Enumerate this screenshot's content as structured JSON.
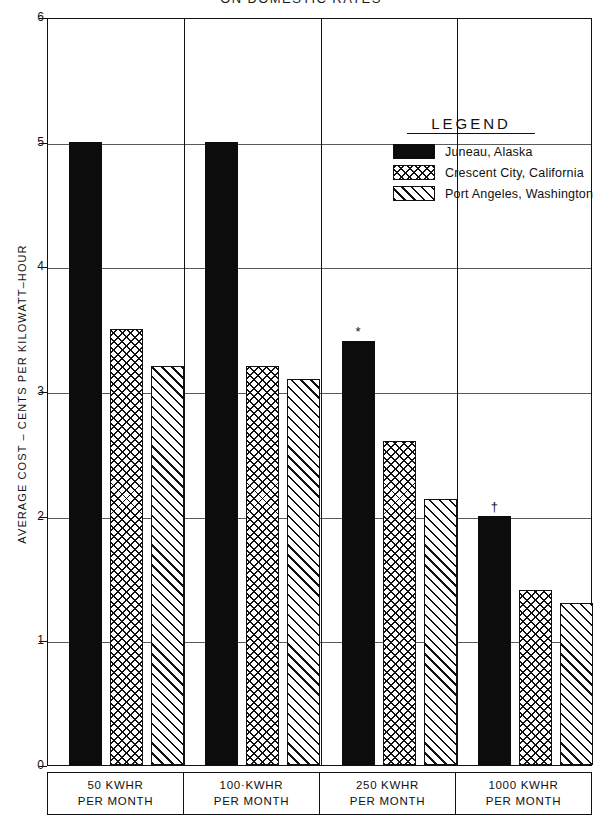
{
  "title": "ON  DOMESTIC  RATES",
  "legend": {
    "heading": "LEGEND",
    "entries": [
      {
        "label": "Juneau, Alaska",
        "pattern": "solid",
        "color": "#0c0c0c"
      },
      {
        "label": "Crescent City, California",
        "pattern": "cross",
        "color": "#111111"
      },
      {
        "label": "Port Angeles, Washington",
        "pattern": "diag",
        "color": "#111111"
      }
    ]
  },
  "axes": {
    "y_title": "AVERAGE COST – CENTS PER KILOWATT–HOUR",
    "y_ticks": [
      "0",
      "1",
      "2",
      "3",
      "4",
      "5",
      "6"
    ],
    "x_categories": [
      {
        "line1": "50 KWHR",
        "line2": "PER MONTH"
      },
      {
        "line1": "100·KWHR",
        "line2": "PER MONTH"
      },
      {
        "line1": "250 KWHR",
        "line2": "PER MONTH"
      },
      {
        "line1": "1000 KWHR",
        "line2": "PER MONTH"
      }
    ]
  },
  "chart_data": {
    "type": "bar",
    "title": "ON  DOMESTIC  RATES",
    "xlabel": "",
    "ylabel": "AVERAGE COST – CENTS PER KILOWATT–HOUR",
    "ylim": [
      0,
      6
    ],
    "yticks": [
      0,
      1,
      2,
      3,
      4,
      5,
      6
    ],
    "grid": true,
    "legend_position": "upper-right-inside",
    "categories": [
      "50 KWHR PER MONTH",
      "100 KWHR PER MONTH",
      "250 KWHR PER MONTH",
      "1000 KWHR PER MONTH"
    ],
    "series": [
      {
        "name": "Juneau, Alaska",
        "values": [
          5.0,
          5.0,
          3.4,
          2.0
        ],
        "markers": [
          "",
          "",
          "*",
          "†"
        ]
      },
      {
        "name": "Crescent City, California",
        "values": [
          3.5,
          3.2,
          2.6,
          1.4
        ],
        "markers": [
          "",
          "",
          "",
          ""
        ]
      },
      {
        "name": "Port Angeles, Washington",
        "values": [
          3.2,
          3.1,
          2.13,
          1.3
        ],
        "markers": [
          "",
          "",
          "",
          ""
        ]
      }
    ]
  }
}
